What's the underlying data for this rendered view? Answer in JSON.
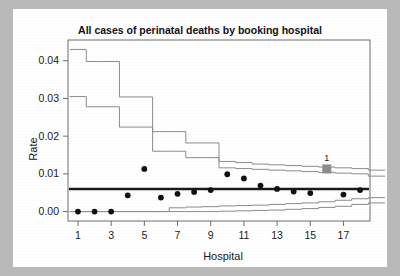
{
  "figure": {
    "background_color": "#b9b9b9",
    "panel_color": "#ffffff"
  },
  "chart_data": {
    "type": "scatter",
    "title": "All cases of perinatal deaths by booking hospital",
    "xlabel": "Hospital",
    "ylabel": "Rate",
    "xlim": [
      0.4,
      18.6
    ],
    "ylim": [
      -0.0025,
      0.0455
    ],
    "grid": false,
    "legend": null,
    "xticks": [
      1,
      3,
      5,
      7,
      9,
      11,
      13,
      15,
      17
    ],
    "xticklabels": [
      "1",
      "3",
      "5",
      "7",
      "9",
      "11",
      "13",
      "15",
      "17"
    ],
    "yticks": [
      0.0,
      0.01,
      0.02,
      0.03,
      0.04
    ],
    "yticklabels": [
      "0.00",
      "0.01",
      "0.02",
      "0.03",
      "0.04"
    ],
    "center_line": {
      "value": 0.006,
      "label": "overall rate",
      "color": "#1a1a1a",
      "width": 2.4
    },
    "x": [
      1,
      2,
      3,
      4,
      5,
      6,
      7,
      8,
      9,
      10,
      11,
      12,
      13,
      14,
      15,
      16,
      17,
      18
    ],
    "series": [
      {
        "name": "Hospital rate",
        "marker": "circle",
        "color": "#111111",
        "values": [
          0.0,
          0.0,
          0.0,
          0.0043,
          0.0113,
          0.0037,
          0.0047,
          0.0052,
          0.0057,
          0.0099,
          0.0088,
          0.0069,
          0.006,
          0.0053,
          0.0049,
          0.0113,
          0.0045,
          0.0057
        ]
      }
    ],
    "highlighted_point": {
      "x": 16,
      "y": 0.0113,
      "label": "1",
      "marker": "square",
      "color": "#8c8c8c"
    },
    "control_limits": [
      {
        "name": "upper 3-sigma",
        "kind": "step",
        "color": "#8c8c8c",
        "values": [
          0.043,
          0.0398,
          0.0398,
          0.0304,
          0.0304,
          0.0212,
          0.0212,
          0.0182,
          0.0182,
          0.0133,
          0.013,
          0.0126,
          0.0124,
          0.0122,
          0.012,
          0.0118,
          0.0116,
          0.0114,
          0.011
        ]
      },
      {
        "name": "upper 2-sigma",
        "kind": "step",
        "color": "#8c8c8c",
        "values": [
          0.0305,
          0.0278,
          0.0278,
          0.0224,
          0.0224,
          0.016,
          0.016,
          0.0143,
          0.0143,
          0.0116,
          0.0114,
          0.0112,
          0.011,
          0.0108,
          0.0106,
          0.0104,
          0.0102,
          0.01,
          0.0094
        ]
      },
      {
        "name": "lower 2-sigma",
        "kind": "step",
        "color": "#8c8c8c",
        "values": [
          0.0,
          0.0,
          0.0,
          0.0,
          0.0,
          0.0,
          0.001,
          0.0012,
          0.0013,
          0.0015,
          0.0016,
          0.0017,
          0.0019,
          0.0021,
          0.0023,
          0.0026,
          0.003,
          0.0034,
          0.0037
        ]
      },
      {
        "name": "lower 3-sigma",
        "kind": "step",
        "color": "#8c8c8c",
        "values": [
          0.0,
          0.0,
          0.0,
          0.0,
          0.0,
          0.0,
          0.0,
          0.0,
          0.0,
          0.0001,
          0.0002,
          0.0003,
          0.0004,
          0.0006,
          0.0008,
          0.0011,
          0.0014,
          0.0019,
          0.0023
        ]
      }
    ]
  }
}
